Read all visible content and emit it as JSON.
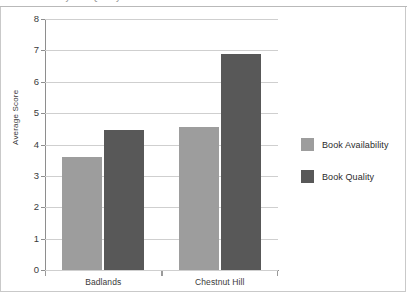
{
  "page": {
    "top_caption": "Book Availability and Quality"
  },
  "chart_data": {
    "type": "bar",
    "title": "",
    "xlabel": "",
    "ylabel": "Average Score",
    "categories": [
      "Badlands",
      "Chestnut Hill"
    ],
    "series": [
      {
        "name": "Book Availability",
        "color": "#9d9d9d",
        "values": [
          3.6,
          4.57
        ]
      },
      {
        "name": "Book Quality",
        "color": "#585858",
        "values": [
          4.45,
          6.9
        ]
      }
    ],
    "ylim": [
      0,
      8
    ],
    "yticks": [
      0,
      1,
      2,
      3,
      4,
      5,
      6,
      7,
      8
    ],
    "ytick_labels": [
      "0",
      "1",
      "2",
      "3",
      "4",
      "5",
      "6",
      "7",
      "8"
    ],
    "grid": true,
    "legend_position": "right"
  }
}
